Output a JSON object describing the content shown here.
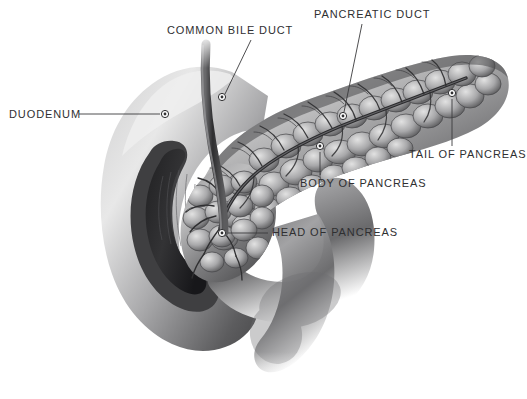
{
  "figure": {
    "background_color": "#ffffff",
    "label_color": "#2f2f31",
    "leader_color": "#3a3a3c",
    "organ_tone_dark": "#3c3c3e",
    "organ_tone_mid": "#8d8d8f",
    "organ_tone_light": "#d8d8d8",
    "duct_color": "#2b2b2d"
  },
  "labels": {
    "duodenum": "DUODENUM",
    "common_bile_duct": "COMMON BILE DUCT",
    "pancreatic_duct": "PANCREATIC DUCT",
    "tail_of_pancreas": "TAIL OF PANCREAS",
    "body_of_pancreas": "BODY OF PANCREAS",
    "head_of_pancreas": "HEAD OF PANCREAS"
  },
  "markers": [
    {
      "name": "duodenum",
      "x": 165,
      "y": 114
    },
    {
      "name": "common-bile-duct",
      "x": 222,
      "y": 97
    },
    {
      "name": "pancreatic-duct",
      "x": 343,
      "y": 116
    },
    {
      "name": "tail-of-pancreas",
      "x": 452,
      "y": 93
    },
    {
      "name": "body-of-pancreas",
      "x": 320,
      "y": 146
    },
    {
      "name": "head-of-pancreas",
      "x": 222,
      "y": 233
    }
  ]
}
